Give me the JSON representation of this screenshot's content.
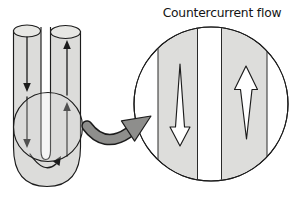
{
  "figure": {
    "title": "Countercurrent flow"
  },
  "flows": {
    "utube_left_limb": "down",
    "utube_right_limb": "up",
    "utube_bend": "around-bend-left-to-right",
    "magnified_left_channel": "down",
    "magnified_right_channel": "up"
  },
  "colors": {
    "background": "#ffffff",
    "outline": "#1c1c1c",
    "tube_fill": "#dcdcda",
    "tube_top_fill": "#e7e7e4",
    "channel_fill": "#dddddb",
    "connector_fill": "#8e8e8c"
  }
}
